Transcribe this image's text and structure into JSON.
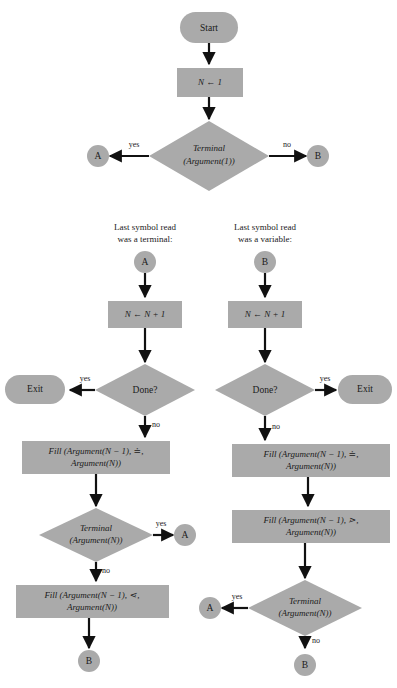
{
  "diagram": {
    "colors": {
      "node_fill": "#aaaaaa",
      "edge": "#111111",
      "background": "#ffffff",
      "text": "#1a1a1a"
    },
    "top_section": {
      "start": "Start",
      "init": "N ← 1",
      "decision_line1": "Terminal",
      "decision_line2": "(Argument(1))",
      "yes_label": "yes",
      "no_label": "no",
      "connector_yes": "A",
      "connector_no": "B"
    },
    "left_branch": {
      "header_line1": "Last symbol read",
      "header_line2": "was a terminal:",
      "entry_connector": "A",
      "increment": "N ← N + 1",
      "done_decision": "Done?",
      "done_yes_label": "yes",
      "done_no_label": "no",
      "exit": "Exit",
      "fill1_line1": "Fill (Argument(N − 1), ≐,",
      "fill1_line2": "Argument(N))",
      "terminal_line1": "Terminal",
      "terminal_line2": "(Argument(N))",
      "terminal_yes_label": "yes",
      "terminal_no_label": "no",
      "terminal_yes_connector": "A",
      "fill2_line1": "Fill (Argument(N − 1), ⋖,",
      "fill2_line2": "Argument(N))",
      "exit_connector": "B"
    },
    "right_branch": {
      "header_line1": "Last symbol read",
      "header_line2": "was a variable:",
      "entry_connector": "B",
      "increment": "N ← N + 1",
      "done_decision": "Done?",
      "done_yes_label": "yes",
      "done_no_label": "no",
      "exit": "Exit",
      "fill1_line1": "Fill (Argument(N − 1), ≐,",
      "fill1_line2": "Argument(N))",
      "fill2_line1": "Fill (Argument(N − 1), ⋗,",
      "fill2_line2": "Argument(N))",
      "terminal_line1": "Terminal",
      "terminal_line2": "(Argument(N))",
      "terminal_yes_label": "yes",
      "terminal_no_label": "no",
      "terminal_yes_connector": "A",
      "exit_connector": "B"
    }
  }
}
